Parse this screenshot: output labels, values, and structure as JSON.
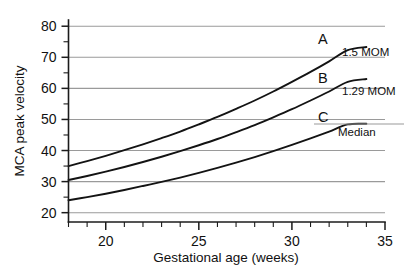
{
  "chart_data": {
    "type": "line",
    "title": "",
    "xlabel": "Gestational age (weeks)",
    "ylabel": "MCA peak velocity",
    "xlim": [
      18,
      35
    ],
    "ylim": [
      17,
      82
    ],
    "grid": true,
    "grid_axis": "y",
    "legend_position": "right-inline",
    "x_ticks_major": [
      20,
      25,
      30,
      35
    ],
    "x_tick_labels": [
      "20",
      "25",
      "30",
      "35"
    ],
    "x_ticks_minor": [
      18,
      19,
      21,
      22,
      23,
      24,
      26,
      27,
      28,
      29,
      31,
      32,
      33,
      34
    ],
    "y_ticks_major": [
      20,
      30,
      40,
      50,
      60,
      70,
      80
    ],
    "y_tick_labels": [
      "20",
      "30",
      "40",
      "50",
      "60",
      "70",
      "80"
    ],
    "y_ticks_minor": [
      25,
      35,
      45,
      55,
      65,
      75
    ],
    "x": [
      18,
      19,
      20,
      21,
      22,
      23,
      24,
      25,
      26,
      27,
      28,
      29,
      30,
      31,
      32,
      33,
      34
    ],
    "series": [
      {
        "name": "A",
        "label": "1.5 MOM",
        "key": "A",
        "values": [
          35.0,
          36.6,
          38.3,
          40.1,
          42.0,
          44.0,
          46.1,
          48.4,
          50.8,
          53.4,
          56.1,
          59.0,
          62.1,
          65.3,
          68.7,
          72.3,
          73.3
        ]
      },
      {
        "name": "B",
        "label": "1.29 MOM",
        "key": "B",
        "values": [
          30.5,
          31.8,
          33.2,
          34.7,
          36.3,
          38.0,
          39.8,
          41.7,
          43.7,
          45.9,
          48.2,
          50.7,
          53.3,
          56.1,
          59.0,
          62.1,
          63.0
        ]
      },
      {
        "name": "C",
        "label": "Median",
        "key": "C",
        "values": [
          24.0,
          25.0,
          26.1,
          27.3,
          28.6,
          29.9,
          31.3,
          32.8,
          34.4,
          36.1,
          37.9,
          39.8,
          41.8,
          43.9,
          46.1,
          48.4,
          48.6
        ]
      }
    ]
  },
  "axes": {
    "y_title": "MCA peak velocity",
    "x_title": "Gestational age (weeks)"
  },
  "annotations": {
    "a_key": "A",
    "a_label": "1.5 MOM",
    "b_key": "B",
    "b_label": "1.29 MOM",
    "c_key": "C",
    "c_label": "Median"
  },
  "colors": {
    "curve": "#131313",
    "grid": "#9a9a9a",
    "axis": "#1b1b1b",
    "background": "#ffffff",
    "text": "#111111"
  }
}
